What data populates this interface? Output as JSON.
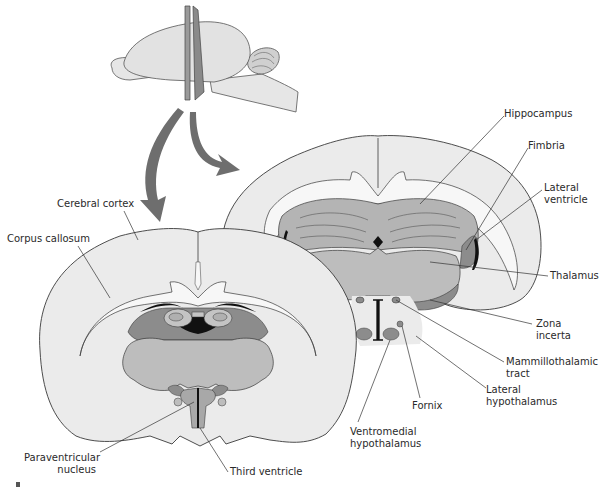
{
  "figure": {
    "colors": {
      "background": "#ffffff",
      "cortex_fill": "#ebebeb",
      "white_matter": "#f7f7f7",
      "hippocampus_fill": "#b4b4b4",
      "thalamus_fill": "#bdbdbd",
      "dark_gray": "#8c8c8c",
      "ventricle_black": "#111111",
      "arrow_fill": "#6e6e6e",
      "outline": "#3a3a3a",
      "label_line": "#333333"
    }
  },
  "labels": {
    "cerebral_cortex": "Cerebral cortex",
    "corpus_callosum": "Corpus callosum",
    "paraventricular_1": "Paraventricular",
    "paraventricular_2": "nucleus",
    "third_ventricle": "Third ventricle",
    "hippocampus": "Hippocampus",
    "fimbria": "Fimbria",
    "lateral_ventricle_1": "Lateral",
    "lateral_ventricle_2": "ventricle",
    "thalamus": "Thalamus",
    "zona_incerta_1": "Zona",
    "zona_incerta_2": "incerta",
    "mammillothalamic_1": "Mammillothalamic",
    "mammillothalamic_2": "tract",
    "lateral_hypothalamus_1": "Lateral",
    "lateral_hypothalamus_2": "hypothalamus",
    "fornix": "Fornix",
    "ventromedial_1": "Ventromedial",
    "ventromedial_2": "hypothalamus"
  }
}
